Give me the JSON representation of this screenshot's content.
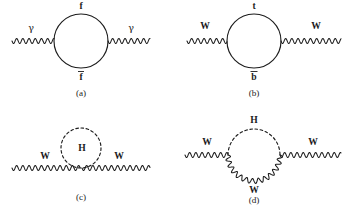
{
  "figure": {
    "kind": "feynman-diagram-set",
    "background_color": "#ffffff",
    "ink_color": "#1c1c1c",
    "width": 353,
    "height": 211,
    "panels": [
      {
        "id": "a",
        "caption": "(a)",
        "caption_x": 81,
        "caption_y": 96,
        "description": "photon self-energy: fermion loop",
        "loop": {
          "style": "solid",
          "cx": 81,
          "cy": 41,
          "r": 27
        },
        "external": [
          {
            "label": "γ",
            "style": "wavy",
            "side": "left",
            "x1": 12,
            "y1": 41,
            "x2": 54,
            "y2": 41,
            "label_x": 31,
            "label_y": 31
          },
          {
            "label": "γ",
            "style": "wavy",
            "side": "right",
            "x1": 108,
            "y1": 41,
            "x2": 150,
            "y2": 41,
            "label_x": 131,
            "label_y": 31
          }
        ],
        "loop_labels": [
          {
            "text": "f",
            "overbar": false,
            "x": 81,
            "y": 9,
            "bar_w": 6
          },
          {
            "text": "f",
            "overbar": true,
            "x": 81,
            "y": 80,
            "bar_w": 6
          }
        ]
      },
      {
        "id": "b",
        "caption": "(b)",
        "caption_x": 254,
        "caption_y": 96,
        "description": "W self-energy: top-bottom quark loop",
        "loop": {
          "style": "solid",
          "cx": 254,
          "cy": 41,
          "r": 27
        },
        "external": [
          {
            "label": "W",
            "style": "wavy",
            "side": "left",
            "x1": 187,
            "y1": 41,
            "x2": 227,
            "y2": 41,
            "label_x": 205,
            "label_y": 29
          },
          {
            "label": "W",
            "style": "wavy",
            "side": "right",
            "x1": 281,
            "y1": 41,
            "x2": 341,
            "y2": 41,
            "label_x": 316,
            "label_y": 29
          }
        ],
        "loop_labels": [
          {
            "text": "t",
            "overbar": false,
            "x": 254,
            "y": 9,
            "bar_w": 5
          },
          {
            "text": "b",
            "overbar": true,
            "x": 254,
            "y": 80,
            "bar_w": 7
          }
        ]
      },
      {
        "id": "c",
        "caption": "(c)",
        "caption_x": 81,
        "caption_y": 200,
        "description": "W self-energy: Higgs tadpole loop on W line",
        "loop": {
          "style": "dashed",
          "cx": 81,
          "cy": 148,
          "r": 20
        },
        "external": [
          {
            "label": "W",
            "style": "wavy",
            "side": "left",
            "x1": 12,
            "y1": 168,
            "x2": 81,
            "y2": 168,
            "label_x": 45,
            "label_y": 159
          },
          {
            "label": "W",
            "style": "wavy",
            "side": "right",
            "x1": 81,
            "y1": 168,
            "x2": 150,
            "y2": 168,
            "label_x": 119,
            "label_y": 159
          }
        ],
        "loop_labels": [
          {
            "text": "H",
            "overbar": false,
            "x": 82,
            "y": 151,
            "bar_w": 0
          }
        ]
      },
      {
        "id": "d",
        "caption": "(d)",
        "caption_x": 254,
        "caption_y": 203,
        "description": "W self-energy: W-Higgs loop",
        "loop": {
          "style": "half-dashed-half-wavy",
          "cx": 254,
          "cy": 155,
          "r": 26
        },
        "external": [
          {
            "label": "W",
            "style": "wavy",
            "side": "left",
            "x1": 185,
            "y1": 155,
            "x2": 228,
            "y2": 155,
            "label_x": 207,
            "label_y": 145
          },
          {
            "label": "W",
            "style": "wavy",
            "side": "right",
            "x1": 280,
            "y1": 155,
            "x2": 341,
            "y2": 155,
            "label_x": 313,
            "label_y": 145
          }
        ],
        "loop_labels": [
          {
            "text": "H",
            "overbar": false,
            "x": 254,
            "y": 123,
            "bar_w": 0
          },
          {
            "text": "W",
            "overbar": false,
            "x": 254,
            "y": 193,
            "bar_w": 0
          }
        ]
      }
    ]
  }
}
